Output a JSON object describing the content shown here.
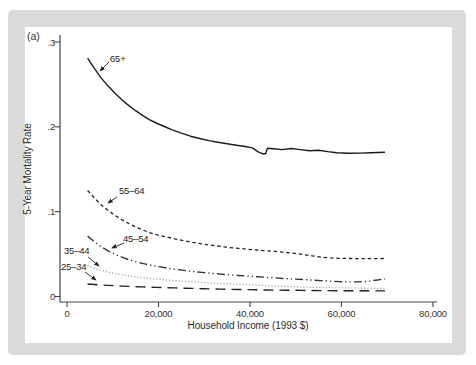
{
  "figure": {
    "panel_tag": "(a)",
    "frame_color": "#dadada",
    "panel_color": "#ffffff",
    "axis_color": "#444444",
    "text_color": "#2e2e2e"
  },
  "chart_data": {
    "type": "line",
    "title": "",
    "xlabel": "Household Income (1993 $)",
    "ylabel": "5-Year Mortality Rate",
    "xlim": [
      0,
      80000
    ],
    "ylim": [
      0,
      0.3
    ],
    "grid": false,
    "legend_position": "inline-labels-with-arrows",
    "x_ticks": [
      {
        "label": "0",
        "value": 0
      },
      {
        "label": "20,000",
        "value": 20000
      },
      {
        "label": "40,000",
        "value": 40000
      },
      {
        "label": "60,000",
        "value": 60000
      },
      {
        "label": "80,000",
        "value": 80000
      }
    ],
    "y_ticks": [
      {
        "label": ".3",
        "value": 0.3
      },
      {
        "label": ".2",
        "value": 0.2
      },
      {
        "label": ".1",
        "value": 0.1
      },
      {
        "label": "0",
        "value": 0
      }
    ],
    "series": [
      {
        "name": "65plus",
        "label": "65+",
        "line_style": "solid",
        "color": "#1b1b1b",
        "points": [
          [
            4500,
            0.281
          ],
          [
            6000,
            0.2685
          ],
          [
            7500,
            0.2575
          ],
          [
            9000,
            0.248
          ],
          [
            10500,
            0.2395
          ],
          [
            12000,
            0.232
          ],
          [
            13500,
            0.225
          ],
          [
            15000,
            0.219
          ],
          [
            16500,
            0.2135
          ],
          [
            18000,
            0.2085
          ],
          [
            19500,
            0.2045
          ],
          [
            21000,
            0.201
          ],
          [
            23000,
            0.1965
          ],
          [
            25000,
            0.1925
          ],
          [
            27000,
            0.189
          ],
          [
            29000,
            0.1862
          ],
          [
            31000,
            0.1838
          ],
          [
            33000,
            0.1818
          ],
          [
            35000,
            0.18
          ],
          [
            37000,
            0.1783
          ],
          [
            39000,
            0.1768
          ],
          [
            40500,
            0.1752
          ],
          [
            41800,
            0.1705
          ],
          [
            42800,
            0.1682
          ],
          [
            43400,
            0.1682
          ],
          [
            43800,
            0.1748
          ],
          [
            45200,
            0.1742
          ],
          [
            47000,
            0.1732
          ],
          [
            49000,
            0.1745
          ],
          [
            51000,
            0.1732
          ],
          [
            53000,
            0.1718
          ],
          [
            55000,
            0.1725
          ],
          [
            57000,
            0.1708
          ],
          [
            59000,
            0.1695
          ],
          [
            61500,
            0.1688
          ],
          [
            64000,
            0.169
          ],
          [
            66500,
            0.1695
          ],
          [
            69500,
            0.17
          ]
        ]
      },
      {
        "name": "55-64",
        "label": "55–64",
        "line_style": "short-dash",
        "color": "#222222",
        "points": [
          [
            4500,
            0.125
          ],
          [
            6000,
            0.116
          ],
          [
            7500,
            0.108
          ],
          [
            9000,
            0.1015
          ],
          [
            10500,
            0.0955
          ],
          [
            12000,
            0.0905
          ],
          [
            13500,
            0.086
          ],
          [
            15000,
            0.082
          ],
          [
            16500,
            0.0785
          ],
          [
            18000,
            0.0755
          ],
          [
            19500,
            0.073
          ],
          [
            21500,
            0.0705
          ],
          [
            23500,
            0.068
          ],
          [
            25500,
            0.0658
          ],
          [
            27500,
            0.0638
          ],
          [
            29500,
            0.062
          ],
          [
            31500,
            0.0605
          ],
          [
            33500,
            0.059
          ],
          [
            35500,
            0.0578
          ],
          [
            37500,
            0.0567
          ],
          [
            39500,
            0.0558
          ],
          [
            41500,
            0.0548
          ],
          [
            43500,
            0.054
          ],
          [
            45500,
            0.0532
          ],
          [
            47500,
            0.0522
          ],
          [
            49500,
            0.051
          ],
          [
            51500,
            0.0495
          ],
          [
            53500,
            0.048
          ],
          [
            55500,
            0.0465
          ],
          [
            57500,
            0.0455
          ],
          [
            59500,
            0.045
          ],
          [
            62000,
            0.0448
          ],
          [
            64500,
            0.0447
          ],
          [
            67000,
            0.0447
          ],
          [
            69500,
            0.0448
          ]
        ]
      },
      {
        "name": "45-54",
        "label": "45–54",
        "line_style": "dash-dot-dot",
        "color": "#333333",
        "points": [
          [
            4500,
            0.0712
          ],
          [
            6000,
            0.0645
          ],
          [
            7500,
            0.0585
          ],
          [
            9000,
            0.0537
          ],
          [
            10500,
            0.0497
          ],
          [
            12000,
            0.0463
          ],
          [
            13500,
            0.0434
          ],
          [
            15000,
            0.041
          ],
          [
            16500,
            0.039
          ],
          [
            18000,
            0.0372
          ],
          [
            19500,
            0.0356
          ],
          [
            21500,
            0.0338
          ],
          [
            23500,
            0.0322
          ],
          [
            25500,
            0.0308
          ],
          [
            27500,
            0.0295
          ],
          [
            29500,
            0.0284
          ],
          [
            31500,
            0.0274
          ],
          [
            33500,
            0.0264
          ],
          [
            35500,
            0.0255
          ],
          [
            37500,
            0.0247
          ],
          [
            39500,
            0.024
          ],
          [
            41500,
            0.0233
          ],
          [
            43500,
            0.0226
          ],
          [
            45500,
            0.0219
          ],
          [
            47500,
            0.0212
          ],
          [
            49500,
            0.0206
          ],
          [
            51500,
            0.02
          ],
          [
            53500,
            0.0193
          ],
          [
            55500,
            0.0187
          ],
          [
            57500,
            0.0181
          ],
          [
            59500,
            0.0176
          ],
          [
            61500,
            0.0172
          ],
          [
            63500,
            0.0172
          ],
          [
            65500,
            0.0178
          ],
          [
            67500,
            0.0192
          ],
          [
            69500,
            0.0208
          ]
        ]
      },
      {
        "name": "35-44",
        "label": "35–44",
        "line_style": "dot",
        "color": "#8f8f8f",
        "points": [
          [
            4500,
            0.0363
          ],
          [
            6000,
            0.0333
          ],
          [
            7500,
            0.0308
          ],
          [
            9000,
            0.0288
          ],
          [
            10500,
            0.0271
          ],
          [
            12000,
            0.0256
          ],
          [
            13500,
            0.0243
          ],
          [
            15000,
            0.0232
          ],
          [
            16500,
            0.0222
          ],
          [
            18000,
            0.0213
          ],
          [
            19500,
            0.0205
          ],
          [
            21500,
            0.0196
          ],
          [
            23500,
            0.0187
          ],
          [
            25500,
            0.0179
          ],
          [
            27500,
            0.0172
          ],
          [
            29500,
            0.0166
          ],
          [
            31500,
            0.016
          ],
          [
            33500,
            0.0154
          ],
          [
            35500,
            0.0148
          ],
          [
            37500,
            0.0143
          ],
          [
            39500,
            0.0138
          ],
          [
            41500,
            0.0133
          ],
          [
            43500,
            0.0128
          ],
          [
            45500,
            0.0124
          ],
          [
            47500,
            0.012
          ],
          [
            49500,
            0.0116
          ],
          [
            51500,
            0.0112
          ],
          [
            53500,
            0.0109
          ],
          [
            55500,
            0.0106
          ],
          [
            57500,
            0.0104
          ],
          [
            59500,
            0.0102
          ],
          [
            61500,
            0.01
          ],
          [
            63500,
            0.0098
          ],
          [
            65500,
            0.0097
          ],
          [
            67500,
            0.0096
          ],
          [
            69500,
            0.0096
          ]
        ]
      },
      {
        "name": "25-34",
        "label": "25–34",
        "line_style": "long-dash",
        "color": "#222222",
        "points": [
          [
            4500,
            0.0147
          ],
          [
            6000,
            0.0141
          ],
          [
            7500,
            0.0136
          ],
          [
            9000,
            0.0131
          ],
          [
            10500,
            0.0127
          ],
          [
            12000,
            0.0123
          ],
          [
            13500,
            0.0119
          ],
          [
            15000,
            0.0116
          ],
          [
            16500,
            0.0113
          ],
          [
            18000,
            0.011
          ],
          [
            19500,
            0.0107
          ],
          [
            21500,
            0.0104
          ],
          [
            23500,
            0.0101
          ],
          [
            25500,
            0.0098
          ],
          [
            27500,
            0.0095
          ],
          [
            29500,
            0.0092
          ],
          [
            31500,
            0.0089
          ],
          [
            33500,
            0.0087
          ],
          [
            35500,
            0.0085
          ],
          [
            37500,
            0.0083
          ],
          [
            39500,
            0.0081
          ],
          [
            41500,
            0.0079
          ],
          [
            43500,
            0.0077
          ],
          [
            45500,
            0.0076
          ],
          [
            47500,
            0.0074
          ],
          [
            49500,
            0.0073
          ],
          [
            51500,
            0.0072
          ],
          [
            53500,
            0.0071
          ],
          [
            55500,
            0.007
          ],
          [
            57500,
            0.0069
          ],
          [
            59500,
            0.0068
          ],
          [
            61500,
            0.0068
          ],
          [
            63500,
            0.0067
          ],
          [
            65500,
            0.0067
          ],
          [
            67500,
            0.0066
          ],
          [
            69500,
            0.0066
          ]
        ]
      }
    ]
  }
}
